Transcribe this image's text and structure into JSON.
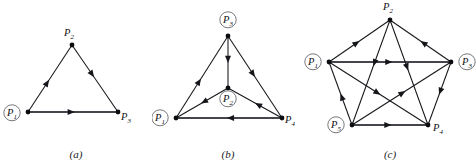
{
  "figure": {
    "background": "#ffffff",
    "ink": "#15161a",
    "ring_color": "#6f7177",
    "panels": [
      {
        "id": "a",
        "caption": "(a)",
        "type": "directed-graph",
        "description": "3-vertex tournament / triangle digraph",
        "nodes": [
          {
            "id": "P1",
            "label": "P",
            "subscript": "1",
            "x": 28,
            "y": 112,
            "circled": true,
            "label_dx": -16,
            "label_dy": 4
          },
          {
            "id": "P2",
            "label": "P",
            "subscript": "2",
            "x": 72,
            "y": 45,
            "circled": false,
            "label_dx": -3,
            "label_dy": -9
          },
          {
            "id": "P3",
            "label": "P",
            "subscript": "3",
            "x": 118,
            "y": 112,
            "circled": false,
            "label_dx": 8,
            "label_dy": 8
          }
        ],
        "edges": [
          {
            "from": "P1",
            "to": "P2",
            "style": "thin",
            "arrow_at": 0.48
          },
          {
            "from": "P2",
            "to": "P3",
            "style": "thin",
            "arrow_at": 0.48
          },
          {
            "from": "P1",
            "to": "P3",
            "style": "thick",
            "arrow_at": 0.52
          }
        ]
      },
      {
        "id": "b",
        "caption": "(b)",
        "type": "directed-graph",
        "description": "4-vertex tournament with central vertex",
        "nodes": [
          {
            "id": "P3",
            "label": "P",
            "subscript": "3",
            "x": 76,
            "y": 36,
            "circled": true,
            "label_dx": 0,
            "label_dy": -13
          },
          {
            "id": "P2",
            "label": "P",
            "subscript": "2",
            "x": 76,
            "y": 88,
            "circled": true,
            "label_dx": 0,
            "label_dy": 14
          },
          {
            "id": "P1",
            "label": "P",
            "subscript": "1",
            "x": 24,
            "y": 118,
            "circled": true,
            "label_dx": -16,
            "label_dy": 3
          },
          {
            "id": "P4",
            "label": "P",
            "subscript": "4",
            "x": 130,
            "y": 118,
            "circled": false,
            "label_dx": 8,
            "label_dy": 5
          }
        ],
        "edges": [
          {
            "from": "P1",
            "to": "P3",
            "style": "thin",
            "arrow_at": 0.48
          },
          {
            "from": "P3",
            "to": "P4",
            "style": "thin",
            "arrow_at": 0.5
          },
          {
            "from": "P3",
            "to": "P2",
            "style": "thin",
            "arrow_at": 0.52
          },
          {
            "from": "P2",
            "to": "P1",
            "style": "thin",
            "arrow_at": 0.52
          },
          {
            "from": "P4",
            "to": "P2",
            "style": "thin",
            "arrow_at": 0.5
          },
          {
            "from": "P4",
            "to": "P1",
            "style": "thick",
            "arrow_at": 0.52
          }
        ]
      },
      {
        "id": "c",
        "caption": "(c)",
        "type": "directed-graph",
        "description": "5-vertex complete tournament (pentagon plus pentagram)",
        "nodes": [
          {
            "id": "P2",
            "label": "P",
            "subscript": "2",
            "x": 86,
            "y": 20,
            "circled": false,
            "label_dx": -2,
            "label_dy": -10
          },
          {
            "id": "P1",
            "label": "P",
            "subscript": "1",
            "x": 25,
            "y": 62,
            "circled": true,
            "label_dx": -16,
            "label_dy": 3
          },
          {
            "id": "P3",
            "label": "P",
            "subscript": "3",
            "x": 147,
            "y": 62,
            "circled": true,
            "label_dx": 16,
            "label_dy": 3
          },
          {
            "id": "P5",
            "label": "P",
            "subscript": "5",
            "x": 48,
            "y": 125,
            "circled": true,
            "label_dx": -16,
            "label_dy": 3
          },
          {
            "id": "P4",
            "label": "P",
            "subscript": "4",
            "x": 124,
            "y": 125,
            "circled": false,
            "label_dx": 10,
            "label_dy": 6
          }
        ],
        "edges": [
          {
            "from": "P1",
            "to": "P2",
            "style": "thin",
            "arrow_at": 0.5
          },
          {
            "from": "P3",
            "to": "P2",
            "style": "thin",
            "arrow_at": 0.5
          },
          {
            "from": "P1",
            "to": "P3",
            "style": "thick",
            "arrow_at": 0.52
          },
          {
            "from": "P5",
            "to": "P1",
            "style": "thin",
            "arrow_at": 0.5
          },
          {
            "from": "P3",
            "to": "P4",
            "style": "thin",
            "arrow_at": 0.52
          },
          {
            "from": "P5",
            "to": "P4",
            "style": "thick",
            "arrow_at": 0.52
          },
          {
            "from": "P2",
            "to": "P5",
            "style": "thin",
            "arrow_at": 0.44
          },
          {
            "from": "P2",
            "to": "P4",
            "style": "thin",
            "arrow_at": 0.48
          },
          {
            "from": "P1",
            "to": "P4",
            "style": "thin",
            "arrow_at": 0.52
          },
          {
            "from": "P5",
            "to": "P3",
            "style": "thin",
            "arrow_at": 0.54
          }
        ]
      }
    ]
  }
}
